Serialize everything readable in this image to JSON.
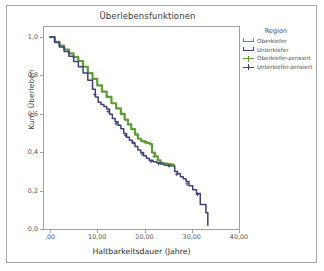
{
  "chart_data": {
    "type": "line",
    "title": "Überlebensfunktionen",
    "xlabel": "Haltbarkeitsdauer (Jahre)",
    "ylabel": "Kum. Überleben",
    "xlim": [
      0,
      40
    ],
    "ylim": [
      0.0,
      1.0
    ],
    "grid": false,
    "legend_position": "right",
    "legend_title": "Region",
    "xticks": [
      ",00",
      "10,00",
      "20,00",
      "30,00",
      "40,00"
    ],
    "xtick_values": [
      0,
      10,
      20,
      30,
      40
    ],
    "yticks": [
      "1,0",
      "0,8",
      "0,6",
      "0,4",
      "0,2",
      "0,0"
    ],
    "ytick_values": [
      1.0,
      0.8,
      0.6,
      0.4,
      0.2,
      0.0
    ],
    "colors": {
      "oberkiefer": "#5d9e33",
      "unterkiefer": "#3f4079",
      "axis": "#9aa3ad",
      "text": "#3a3a3a",
      "border": "#a8a8a8"
    },
    "series": [
      {
        "name": "Oberkiefer",
        "color": "#5d9e33",
        "style": "step",
        "points": [
          [
            0.0,
            1.0
          ],
          [
            1.0,
            0.975
          ],
          [
            2.0,
            0.955
          ],
          [
            3.0,
            0.935
          ],
          [
            4.0,
            0.915
          ],
          [
            5.0,
            0.895
          ],
          [
            6.0,
            0.875
          ],
          [
            7.0,
            0.845
          ],
          [
            8.0,
            0.812
          ],
          [
            9.0,
            0.782
          ],
          [
            10.0,
            0.748
          ],
          [
            11.0,
            0.715
          ],
          [
            12.0,
            0.688
          ],
          [
            13.0,
            0.655
          ],
          [
            14.0,
            0.628
          ],
          [
            15.0,
            0.6
          ],
          [
            15.8,
            0.57
          ],
          [
            16.5,
            0.545
          ],
          [
            17.2,
            0.52
          ],
          [
            18.0,
            0.492
          ],
          [
            18.6,
            0.47
          ],
          [
            19.3,
            0.458
          ],
          [
            20.0,
            0.452
          ],
          [
            20.6,
            0.448
          ],
          [
            21.2,
            0.442
          ],
          [
            21.6,
            0.398
          ],
          [
            22.2,
            0.378
          ],
          [
            22.8,
            0.358
          ],
          [
            23.4,
            0.345
          ],
          [
            24.0,
            0.34
          ],
          [
            24.8,
            0.338
          ],
          [
            25.6,
            0.335
          ],
          [
            26.2,
            0.332
          ]
        ]
      },
      {
        "name": "Unterkiefer",
        "color": "#3f4079",
        "style": "step",
        "points": [
          [
            0.0,
            1.0
          ],
          [
            1.0,
            0.972
          ],
          [
            2.0,
            0.948
          ],
          [
            3.0,
            0.925
          ],
          [
            4.0,
            0.9
          ],
          [
            5.0,
            0.872
          ],
          [
            6.0,
            0.845
          ],
          [
            7.0,
            0.812
          ],
          [
            8.0,
            0.775
          ],
          [
            9.0,
            0.728
          ],
          [
            9.6,
            0.688
          ],
          [
            10.2,
            0.66
          ],
          [
            10.8,
            0.648
          ],
          [
            11.4,
            0.638
          ],
          [
            12.0,
            0.625
          ],
          [
            12.6,
            0.598
          ],
          [
            13.2,
            0.575
          ],
          [
            13.8,
            0.558
          ],
          [
            14.4,
            0.54
          ],
          [
            15.0,
            0.522
          ],
          [
            15.6,
            0.498
          ],
          [
            16.2,
            0.478
          ],
          [
            16.8,
            0.462
          ],
          [
            17.4,
            0.448
          ],
          [
            18.0,
            0.43
          ],
          [
            18.6,
            0.412
          ],
          [
            19.2,
            0.398
          ],
          [
            19.8,
            0.382
          ],
          [
            20.4,
            0.368
          ],
          [
            21.0,
            0.358
          ],
          [
            21.8,
            0.35
          ],
          [
            22.6,
            0.345
          ],
          [
            23.4,
            0.338
          ],
          [
            24.2,
            0.332
          ],
          [
            25.0,
            0.33
          ],
          [
            25.8,
            0.328
          ],
          [
            26.4,
            0.3
          ],
          [
            27.0,
            0.288
          ],
          [
            27.6,
            0.272
          ],
          [
            28.2,
            0.262
          ],
          [
            28.8,
            0.248
          ],
          [
            29.4,
            0.225
          ],
          [
            30.2,
            0.205
          ],
          [
            31.0,
            0.185
          ],
          [
            31.8,
            0.128
          ],
          [
            33.0,
            0.085
          ],
          [
            33.4,
            0.02
          ]
        ]
      }
    ],
    "censored": [
      {
        "name": "Oberkiefer-zensiert",
        "color": "#5d9e33",
        "marker": "plus",
        "points": [
          [
            15.2,
            0.6
          ],
          [
            18.5,
            0.492
          ],
          [
            20.2,
            0.452
          ],
          [
            22.0,
            0.378
          ],
          [
            24.5,
            0.338
          ],
          [
            25.9,
            0.332
          ]
        ]
      },
      {
        "name": "Unterkiefer-zensiert",
        "color": "#3f4079",
        "marker": "plus",
        "points": [
          [
            9.5,
            0.7
          ],
          [
            12.3,
            0.612
          ],
          [
            14.0,
            0.548
          ],
          [
            16.0,
            0.488
          ],
          [
            17.6,
            0.45
          ],
          [
            19.5,
            0.39
          ],
          [
            21.4,
            0.352
          ],
          [
            23.0,
            0.34
          ],
          [
            25.2,
            0.329
          ],
          [
            26.8,
            0.285
          ],
          [
            29.0,
            0.235
          ],
          [
            31.2,
            0.18
          ]
        ]
      }
    ]
  },
  "legend": {
    "title": "Region",
    "items": [
      {
        "label": "Oberkiefer",
        "color": "#5d9e33",
        "kind": "line"
      },
      {
        "label": "Unterkiefer",
        "color": "#3f4079",
        "kind": "line"
      },
      {
        "label": "Oberkiefer-zensiert",
        "color": "#5d9e33",
        "kind": "censor"
      },
      {
        "label": "Unterkiefer-zensiert",
        "color": "#3f4079",
        "kind": "censor"
      }
    ]
  }
}
